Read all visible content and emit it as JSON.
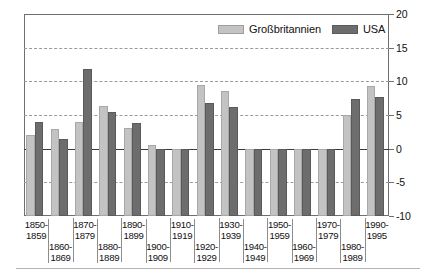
{
  "legend": {
    "position": "top-right",
    "items": [
      {
        "label": "Großbritannien",
        "color": "#c3c3c3",
        "key": "gb"
      },
      {
        "label": "USA",
        "color": "#6d6d6d",
        "key": "us"
      }
    ]
  },
  "yaxis": {
    "ticks": [
      "20",
      "15",
      "10",
      "5",
      "0",
      "-5",
      "-10"
    ],
    "values": [
      20,
      15,
      10,
      5,
      0,
      -5,
      -10
    ],
    "min": -10,
    "max": 20
  },
  "chart_data": {
    "type": "bar",
    "title": "",
    "subtitle": "",
    "xlabel": "",
    "ylabel": "",
    "ylim": [
      -10,
      20
    ],
    "grid": true,
    "legend_position": "top-right",
    "categories": [
      "1850-\n1859",
      "1860-\n1869",
      "1870-\n1879",
      "1880-\n1889",
      "1890-\n1899",
      "1900-\n1909",
      "1910-\n1919",
      "1920-\n1929",
      "1930-\n1939",
      "1940-\n1949",
      "1950-\n1959",
      "1960-\n1969",
      "1970-\n1979",
      "1980-\n1989",
      "1990-\n1995"
    ],
    "category_lines": [
      [
        "1850-",
        "1859"
      ],
      [
        "1860-",
        "1869"
      ],
      [
        "1870-",
        "1879"
      ],
      [
        "1880-",
        "1889"
      ],
      [
        "1890-",
        "1899"
      ],
      [
        "1900-",
        "1909"
      ],
      [
        "1910-",
        "1919"
      ],
      [
        "1920-",
        "1929"
      ],
      [
        "1930-",
        "1939"
      ],
      [
        "1940-",
        "1949"
      ],
      [
        "1950-",
        "1959"
      ],
      [
        "1960-",
        "1969"
      ],
      [
        "1970-",
        "1979"
      ],
      [
        "1980-",
        "1989"
      ],
      [
        "1990-",
        "1995"
      ]
    ],
    "series": [
      {
        "name": "Großbritannien",
        "color": "#c3c3c3",
        "values": [
          2.1,
          2.9,
          3.9,
          6.4,
          3.1,
          0.6,
          -8.3,
          9.4,
          8.6,
          -5.8,
          -3.0,
          -3.0,
          -3.3,
          5.0,
          9.3
        ]
      },
      {
        "name": "USA",
        "color": "#6d6d6d",
        "values": [
          4.0,
          1.5,
          11.8,
          5.4,
          3.8,
          0.0,
          -5.0,
          6.8,
          6.2,
          -3.0,
          -2.0,
          -0.9,
          -3.0,
          7.4,
          7.6
        ]
      }
    ]
  }
}
